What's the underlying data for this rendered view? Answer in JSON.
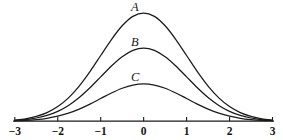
{
  "figure": {
    "background_color": "#ffffff",
    "ink_color": "#1a1a1a"
  },
  "chart_data": {
    "type": "line",
    "title": "",
    "xlabel": "",
    "ylabel": "",
    "xlim": [
      -3,
      3
    ],
    "ylim": [
      0,
      1
    ],
    "grid": false,
    "legend": "inline-curve-labels",
    "axis": {
      "baseline_only": true,
      "tick_values": [
        -3,
        -2,
        -1,
        0,
        1,
        2,
        3
      ],
      "tick_labels": [
        "-3",
        "-2",
        "-1",
        "0",
        "1",
        "2",
        "3"
      ],
      "tick_direction": "up"
    },
    "x": [
      -3,
      -2.75,
      -2.5,
      -2.25,
      -2,
      -1.75,
      -1.5,
      -1.25,
      -1,
      -0.75,
      -0.5,
      -0.25,
      0,
      0.25,
      0.5,
      0.75,
      1,
      1.25,
      1.5,
      1.75,
      2,
      2.25,
      2.5,
      2.75,
      3
    ],
    "series": [
      {
        "name": "A",
        "label": "A",
        "peak_x": 0,
        "peak_y": 1.0,
        "sigma": 1.0,
        "values": [
          0.011,
          0.022,
          0.044,
          0.079,
          0.135,
          0.216,
          0.325,
          0.458,
          0.607,
          0.755,
          0.882,
          0.969,
          1.0,
          0.969,
          0.882,
          0.755,
          0.607,
          0.458,
          0.325,
          0.216,
          0.135,
          0.079,
          0.044,
          0.022,
          0.011
        ]
      },
      {
        "name": "B",
        "label": "B",
        "peak_x": 0,
        "peak_y": 0.675,
        "sigma": 1.0,
        "values": [
          0.0074,
          0.0149,
          0.0297,
          0.0533,
          0.0911,
          0.1458,
          0.2194,
          0.3092,
          0.4096,
          0.5096,
          0.5953,
          0.6541,
          0.675,
          0.6541,
          0.5953,
          0.5096,
          0.4096,
          0.3092,
          0.2194,
          0.1458,
          0.0911,
          0.0533,
          0.0297,
          0.0149,
          0.0074
        ]
      },
      {
        "name": "C",
        "label": "C",
        "peak_x": 0,
        "peak_y": 0.345,
        "sigma": 1.0,
        "values": [
          0.0038,
          0.0076,
          0.0152,
          0.0272,
          0.0466,
          0.0745,
          0.1121,
          0.158,
          0.2094,
          0.2604,
          0.3043,
          0.3343,
          0.345,
          0.3343,
          0.3043,
          0.2604,
          0.2094,
          0.158,
          0.1121,
          0.0745,
          0.0466,
          0.0272,
          0.0152,
          0.0076,
          0.0038
        ]
      }
    ]
  },
  "labels": {
    "curve_a": "A",
    "curve_b": "B",
    "curve_c": "C"
  },
  "ticks": [
    {
      "value": -3,
      "text": "-3"
    },
    {
      "value": -2,
      "text": "-2"
    },
    {
      "value": -1,
      "text": "-1"
    },
    {
      "value": 0,
      "text": "0"
    },
    {
      "value": 1,
      "text": "1"
    },
    {
      "value": 2,
      "text": "2"
    },
    {
      "value": 3,
      "text": "3"
    }
  ]
}
